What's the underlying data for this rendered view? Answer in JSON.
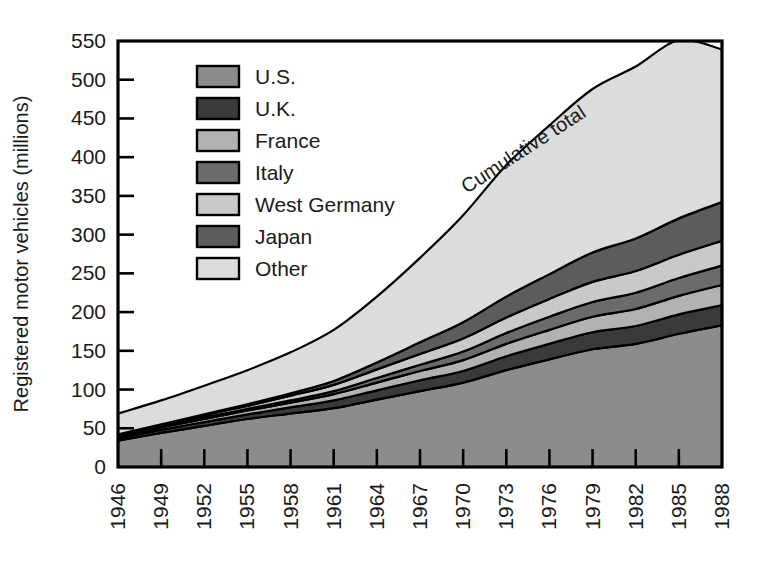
{
  "chart_data": {
    "type": "area",
    "title": "",
    "xlabel": "",
    "ylabel": "Registered motor vehicles (millions)",
    "ylim": [
      0,
      550
    ],
    "ytick_values": [
      0,
      50,
      100,
      150,
      200,
      250,
      300,
      350,
      400,
      450,
      500,
      550
    ],
    "ytick_labels": [
      "0",
      "50",
      "100",
      "150",
      "200",
      "250",
      "300",
      "350",
      "400",
      "450",
      "500",
      "550"
    ],
    "grid": false,
    "legend_position": "upper-left-inside",
    "stacked": true,
    "annotations": [
      {
        "text": "Cumulative total",
        "rotation": -33
      }
    ],
    "x": [
      1946,
      1949,
      1952,
      1955,
      1958,
      1961,
      1964,
      1967,
      1970,
      1973,
      1976,
      1979,
      1982,
      1985,
      1988
    ],
    "xtick_labels": [
      "1946",
      "1949",
      "1952",
      "1955",
      "1958",
      "1961",
      "1964",
      "1967",
      "1970",
      "1973",
      "1976",
      "1979",
      "1982",
      "1985",
      "1988"
    ],
    "series": [
      {
        "name": "U.S.",
        "color": "#8c8c8c",
        "values": [
          34,
          44,
          53,
          62,
          69,
          76,
          87,
          98,
          109,
          125,
          139,
          152,
          159,
          172,
          183
        ]
      },
      {
        "name": "U.K.",
        "color": "#3a3a3a",
        "values": [
          3,
          4,
          5,
          6,
          8,
          10,
          12,
          14,
          15,
          18,
          20,
          22,
          23,
          25,
          26
        ]
      },
      {
        "name": "France",
        "color": "#b2b2b2",
        "values": [
          2,
          3,
          4,
          5,
          6,
          8,
          10,
          12,
          14,
          16,
          18,
          20,
          22,
          24,
          26
        ]
      },
      {
        "name": "Italy",
        "color": "#6b6b6b",
        "values": [
          1,
          1,
          2,
          2,
          3,
          4,
          6,
          8,
          11,
          14,
          17,
          19,
          21,
          23,
          25
        ]
      },
      {
        "name": "West Germany",
        "color": "#c9c9c9",
        "values": [
          1,
          2,
          3,
          4,
          6,
          8,
          11,
          14,
          17,
          20,
          23,
          26,
          28,
          30,
          32
        ]
      },
      {
        "name": "Japan",
        "color": "#5c5c5c",
        "values": [
          1,
          1,
          1,
          2,
          3,
          5,
          9,
          15,
          21,
          27,
          32,
          38,
          42,
          47,
          50
        ]
      },
      {
        "name": "Other",
        "color": "#dcdcdc",
        "values": [
          27,
          31,
          37,
          44,
          53,
          66,
          85,
          109,
          138,
          170,
          192,
          211,
          222,
          230,
          197
        ]
      }
    ],
    "cumulative_total": [
      69,
      86,
      105,
      125,
      148,
      177,
      220,
      270,
      325,
      390,
      441,
      488,
      517,
      551,
      539
    ]
  }
}
